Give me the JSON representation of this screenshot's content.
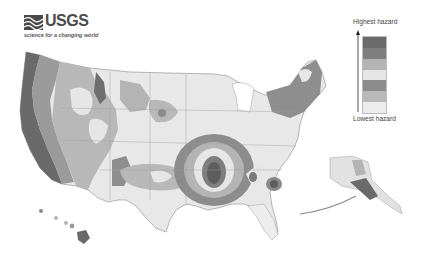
{
  "logo": {
    "wordmark": "USGS",
    "tagline": "science for a changing world"
  },
  "legend": {
    "top_label": "Highest hazard",
    "bottom_label": "Lowest hazard",
    "swatches": [
      {
        "level": 7,
        "color": "#6b6b6b"
      },
      {
        "level": 6,
        "color": "#7e7e7e"
      },
      {
        "level": 5,
        "color": "#b4b4b4"
      },
      {
        "level": 4,
        "color": "#e6e6e6"
      },
      {
        "level": 3,
        "color": "#8c8c8c"
      },
      {
        "level": 2,
        "color": "#b9b9b9"
      },
      {
        "level": 1,
        "color": "#ececec"
      }
    ]
  },
  "map": {
    "title": "U.S. seismic hazard map",
    "regions": [
      "Contiguous United States",
      "Alaska",
      "Hawaii"
    ]
  }
}
